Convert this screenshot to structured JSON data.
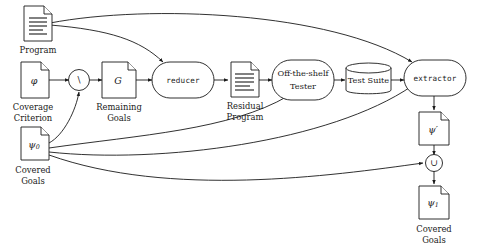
{
  "diagram": {
    "type": "flow-diagram",
    "background_color": "#ffffff",
    "stroke_color": "#1a1a1a",
    "nodes": [
      {
        "id": "program",
        "kind": "document",
        "symbol": "",
        "caption_line1": "Program",
        "caption_line2": ""
      },
      {
        "id": "coverage-criterion",
        "kind": "document",
        "symbol": "φ",
        "caption_line1": "Coverage",
        "caption_line2": "Criterion"
      },
      {
        "id": "covered-goals-0",
        "kind": "document",
        "symbol": "ψ",
        "symbol_sub": "0",
        "caption_line1": "Covered",
        "caption_line2": "Goals"
      },
      {
        "id": "setminus",
        "kind": "circle-op",
        "symbol": "\\",
        "caption_line1": "",
        "caption_line2": ""
      },
      {
        "id": "remaining-goals",
        "kind": "document",
        "symbol": "G",
        "caption_line1": "Remaining",
        "caption_line2": "Goals"
      },
      {
        "id": "reducer",
        "kind": "rounded-process",
        "label": "reducer",
        "caption_line1": "",
        "caption_line2": ""
      },
      {
        "id": "residual-program",
        "kind": "document",
        "symbol": "",
        "caption_line1": "Residual",
        "caption_line2": "Program"
      },
      {
        "id": "tester",
        "kind": "rounded-process",
        "label_line1": "Off-the-shelf",
        "label_line2": "Tester"
      },
      {
        "id": "test-suite",
        "kind": "cylinder",
        "label": "Test Suite"
      },
      {
        "id": "extractor",
        "kind": "rounded-process",
        "label": "extractor"
      },
      {
        "id": "psi-prime",
        "kind": "document",
        "symbol": "ψ′",
        "caption_line1": "",
        "caption_line2": ""
      },
      {
        "id": "union",
        "kind": "circle-op",
        "symbol": "∪"
      },
      {
        "id": "covered-goals-1",
        "kind": "document",
        "symbol": "ψ",
        "symbol_sub": "1",
        "caption_line1": "Covered",
        "caption_line2": "Goals"
      }
    ],
    "edges": [
      {
        "from": "program",
        "to": "extractor"
      },
      {
        "from": "program",
        "to": "reducer"
      },
      {
        "from": "coverage-criterion",
        "to": "setminus"
      },
      {
        "from": "covered-goals-0",
        "to": "setminus"
      },
      {
        "from": "covered-goals-0",
        "to": "tester"
      },
      {
        "from": "covered-goals-0",
        "to": "extractor"
      },
      {
        "from": "covered-goals-0",
        "to": "union"
      },
      {
        "from": "setminus",
        "to": "remaining-goals"
      },
      {
        "from": "remaining-goals",
        "to": "reducer"
      },
      {
        "from": "reducer",
        "to": "residual-program"
      },
      {
        "from": "residual-program",
        "to": "tester"
      },
      {
        "from": "tester",
        "to": "test-suite"
      },
      {
        "from": "test-suite",
        "to": "extractor"
      },
      {
        "from": "extractor",
        "to": "psi-prime"
      },
      {
        "from": "psi-prime",
        "to": "union"
      },
      {
        "from": "union",
        "to": "covered-goals-1"
      }
    ]
  }
}
